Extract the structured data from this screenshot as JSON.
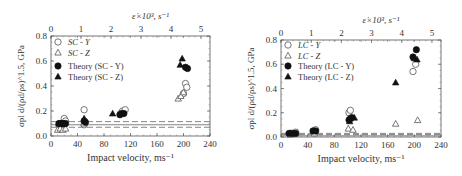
{
  "chart_data": [
    {
      "type": "scatter",
      "panel": "left",
      "title": "",
      "xlabel": "Impact velocity, ms⁻¹",
      "ylabel": "σpl d/(ρd/ρs)^1.5, GPa",
      "top_xlabel": "ε̇×10³, s⁻¹",
      "xlim": [
        0,
        240
      ],
      "ylim": [
        0.0,
        0.8
      ],
      "top_xlim": [
        0,
        5.3
      ],
      "x_ticks": [
        "0",
        "40",
        "80",
        "120",
        "160",
        "200",
        "240"
      ],
      "y_ticks": [
        "0.0",
        "0.2",
        "0.4",
        "0.6",
        "0.8"
      ],
      "top_x_ticks": [
        "0",
        "1",
        "2",
        "3",
        "4",
        "5"
      ],
      "legend": [
        "SC - Y",
        "SC - Z",
        "Theory (SC - Y)",
        "Theory (SC - Z)"
      ],
      "legend_position": "upper left",
      "reference_lines": [
        {
          "style": "solid",
          "y": 0.09
        },
        {
          "style": "dashed",
          "y": 0.115
        },
        {
          "style": "dashed",
          "y": 0.07
        }
      ],
      "series": [
        {
          "name": "SC - Y",
          "marker": "open-circle",
          "points": [
            [
              12,
              0.09
            ],
            [
              15,
              0.1
            ],
            [
              20,
              0.14
            ],
            [
              22,
              0.12
            ],
            [
              50,
              0.21
            ],
            [
              50,
              0.09
            ],
            [
              105,
              0.18
            ],
            [
              108,
              0.2
            ],
            [
              112,
              0.21
            ],
            [
              200,
              0.34
            ],
            [
              203,
              0.42
            ],
            [
              205,
              0.39
            ]
          ]
        },
        {
          "name": "SC - Z",
          "marker": "open-triangle",
          "points": [
            [
              10,
              0.05
            ],
            [
              14,
              0.06
            ],
            [
              18,
              0.05
            ],
            [
              22,
              0.06
            ],
            [
              50,
              0.1
            ],
            [
              192,
              0.3
            ],
            [
              196,
              0.32
            ],
            [
              200,
              0.35
            ]
          ]
        },
        {
          "name": "Theory (SC - Y)",
          "marker": "filled-circle",
          "points": [
            [
              12,
              0.1
            ],
            [
              15,
              0.1
            ],
            [
              18,
              0.1
            ],
            [
              22,
              0.1
            ],
            [
              50,
              0.12
            ],
            [
              52,
              0.11
            ],
            [
              104,
              0.17
            ],
            [
              107,
              0.18
            ],
            [
              110,
              0.18
            ],
            [
              203,
              0.55
            ],
            [
              206,
              0.54
            ]
          ]
        },
        {
          "name": "Theory (SC - Z)",
          "marker": "filled-triangle",
          "points": [
            [
              12,
              0.1
            ],
            [
              16,
              0.1
            ],
            [
              20,
              0.1
            ],
            [
              50,
              0.14
            ],
            [
              93,
              0.18
            ],
            [
              195,
              0.57
            ],
            [
              198,
              0.62
            ]
          ]
        }
      ]
    },
    {
      "type": "scatter",
      "panel": "right",
      "title": "",
      "xlabel": "Impact velocity, ms⁻¹",
      "ylabel": "σpl d/(ρd/ρs)^1.5, GPa",
      "top_xlabel": "ε̇×10³, s⁻¹",
      "xlim": [
        0,
        240
      ],
      "ylim": [
        0.0,
        0.8
      ],
      "top_xlim": [
        0,
        5.3
      ],
      "x_ticks": [
        "0",
        "40",
        "80",
        "120",
        "160",
        "200",
        "240"
      ],
      "y_ticks": [
        "0.0",
        "0.2",
        "0.4",
        "0.6",
        "0.8"
      ],
      "top_x_ticks": [
        "0",
        "1",
        "2",
        "3",
        "4",
        "5"
      ],
      "legend": [
        "LC - Y",
        "LC - Z",
        "Theory (LC - Y)",
        "Theory (LC - Z)"
      ],
      "legend_position": "upper left",
      "reference_lines": [
        {
          "style": "solid",
          "y": 0.01
        },
        {
          "style": "dashed",
          "y": 0.03
        },
        {
          "style": "dashed",
          "y": 0.02
        }
      ],
      "series": [
        {
          "name": "LC - Y",
          "marker": "open-circle",
          "points": [
            [
              14,
              0.03
            ],
            [
              18,
              0.03
            ],
            [
              22,
              0.04
            ],
            [
              50,
              0.05
            ],
            [
              52,
              0.06
            ],
            [
              102,
              0.2
            ],
            [
              104,
              0.22
            ],
            [
              198,
              0.54
            ],
            [
              202,
              0.6
            ]
          ]
        },
        {
          "name": "LC - Z",
          "marker": "open-triangle",
          "points": [
            [
              14,
              0.02
            ],
            [
              22,
              0.03
            ],
            [
              50,
              0.03
            ],
            [
              101,
              0.07
            ],
            [
              108,
              0.06
            ],
            [
              172,
              0.11
            ],
            [
              205,
              0.14
            ]
          ]
        },
        {
          "name": "Theory (LC - Y)",
          "marker": "filled-circle",
          "points": [
            [
              12,
              0.03
            ],
            [
              16,
              0.03
            ],
            [
              22,
              0.03
            ],
            [
              48,
              0.05
            ],
            [
              52,
              0.05
            ],
            [
              102,
              0.14
            ],
            [
              104,
              0.15
            ],
            [
              106,
              0.16
            ],
            [
              198,
              0.66
            ],
            [
              203,
              0.72
            ]
          ]
        },
        {
          "name": "Theory (LC - Z)",
          "marker": "filled-triangle",
          "points": [
            [
              14,
              0.03
            ],
            [
              20,
              0.03
            ],
            [
              50,
              0.05
            ],
            [
              103,
              0.13
            ],
            [
              110,
              0.16
            ],
            [
              172,
              0.45
            ],
            [
              200,
              0.65
            ],
            [
              204,
              0.64
            ]
          ]
        }
      ]
    }
  ]
}
